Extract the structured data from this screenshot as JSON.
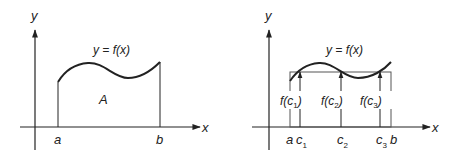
{
  "left_panel": {
    "y_axis_label": "y",
    "x_axis_label": "x",
    "curve_label": "y = f(x)",
    "area_label": "A",
    "a_label": "a",
    "b_label": "b"
  },
  "right_panel": {
    "y_axis_label": "y",
    "x_axis_label": "x",
    "curve_label": "y = f(x)",
    "a_label": "a",
    "b_label": "b",
    "c_labels": [
      {
        "base": "c",
        "sub": "1"
      },
      {
        "base": "c",
        "sub": "2"
      },
      {
        "base": "c",
        "sub": "3"
      }
    ],
    "fc_labels": [
      {
        "pre": "f(",
        "base": "c",
        "sub": "1",
        "post": ")"
      },
      {
        "pre": "f(",
        "base": "c",
        "sub": "2",
        "post": ")"
      },
      {
        "pre": "f(",
        "base": "c",
        "sub": "3",
        "post": ")"
      }
    ]
  },
  "colors": {
    "line": "#222222",
    "rect": "#555555",
    "background": "#ffffff"
  }
}
